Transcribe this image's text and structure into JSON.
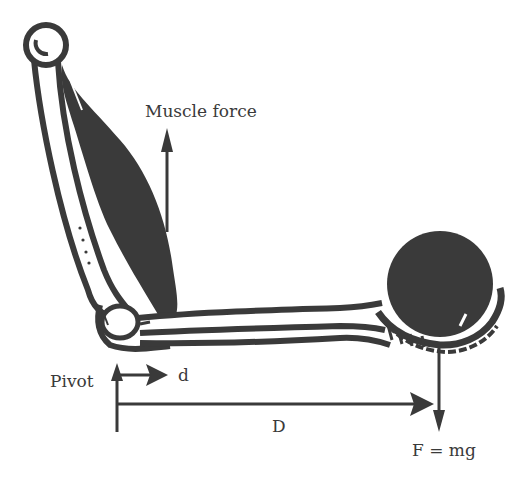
{
  "diagram": {
    "type": "biomechanics-lever",
    "colors": {
      "ink": "#3a3a3a",
      "background": "#ffffff"
    },
    "labels": {
      "muscle_force": "Muscle force",
      "pivot": "Pivot",
      "small_distance": "d",
      "large_distance": "D",
      "weight_force": "F = mg"
    },
    "elements": [
      {
        "name": "upper-arm-bone",
        "description": "humerus"
      },
      {
        "name": "biceps-muscle",
        "description": "dark muscle mass"
      },
      {
        "name": "forearm-bones",
        "description": "radius and ulna"
      },
      {
        "name": "hand",
        "description": "cupped hand with finger bones"
      },
      {
        "name": "ball",
        "description": "dark sphere held in hand"
      },
      {
        "name": "muscle-force-arrow",
        "direction": "up"
      },
      {
        "name": "pivot-arrow",
        "direction": "up"
      },
      {
        "name": "d-arrow",
        "direction": "right"
      },
      {
        "name": "D-arrow",
        "direction": "right"
      },
      {
        "name": "weight-arrow",
        "direction": "down"
      }
    ]
  }
}
